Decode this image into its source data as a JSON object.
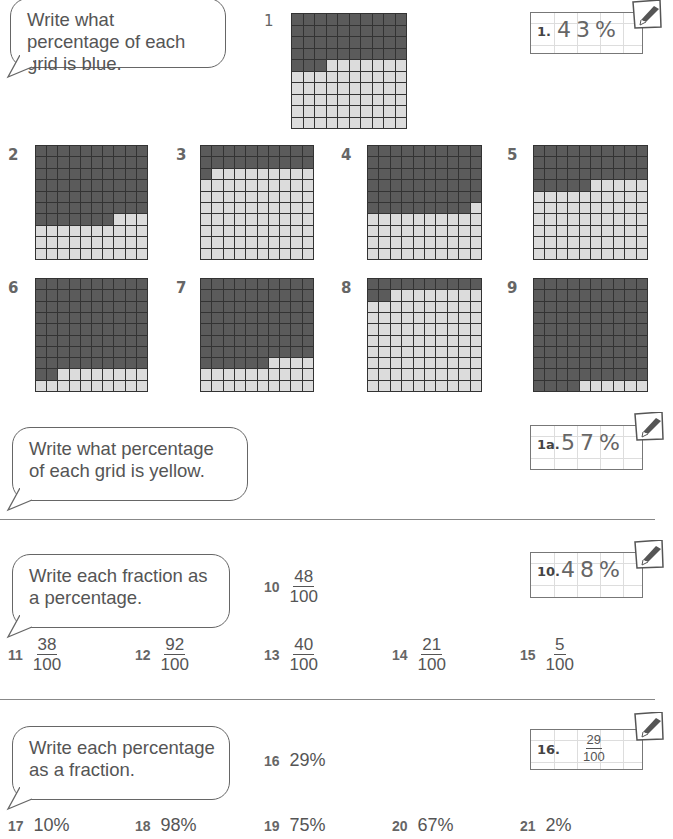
{
  "sections": {
    "blue": {
      "instruction": "Write what percentage of each grid is blue.",
      "example": {
        "label": "1.",
        "answer": "43%"
      },
      "grids": [
        {
          "number": "1",
          "filled": 43
        },
        {
          "number": "2",
          "filled": 67
        },
        {
          "number": "3",
          "filled": 21
        },
        {
          "number": "4",
          "filled": 59
        },
        {
          "number": "5",
          "filled": 35
        },
        {
          "number": "6",
          "filled": 82
        },
        {
          "number": "7",
          "filled": 76
        },
        {
          "number": "8",
          "filled": 12
        },
        {
          "number": "9",
          "filled": 94
        }
      ]
    },
    "yellow": {
      "instruction": "Write what percentage of each grid is yellow.",
      "example": {
        "label": "1a.",
        "answer": "57%"
      }
    },
    "fraction_to_percent": {
      "instruction": "Write each fraction as a percentage.",
      "example": {
        "label": "10.",
        "answer": "48%"
      },
      "items": [
        {
          "number": "10",
          "numerator": "48",
          "denominator": "100"
        },
        {
          "number": "11",
          "numerator": "38",
          "denominator": "100"
        },
        {
          "number": "12",
          "numerator": "92",
          "denominator": "100"
        },
        {
          "number": "13",
          "numerator": "40",
          "denominator": "100"
        },
        {
          "number": "14",
          "numerator": "21",
          "denominator": "100"
        },
        {
          "number": "15",
          "numerator": "5",
          "denominator": "100"
        }
      ]
    },
    "percent_to_fraction": {
      "instruction": "Write each percentage as a fraction.",
      "example": {
        "label": "16.",
        "numerator": "29",
        "denominator": "100"
      },
      "items": [
        {
          "number": "16",
          "value": "29%"
        },
        {
          "number": "17",
          "value": "10%"
        },
        {
          "number": "18",
          "value": "98%"
        },
        {
          "number": "19",
          "value": "75%"
        },
        {
          "number": "20",
          "value": "67%"
        },
        {
          "number": "21",
          "value": "2%"
        }
      ]
    }
  },
  "colors": {
    "filled": "#5b5b5b",
    "empty": "#dcdcdc",
    "gridline": "#333333"
  }
}
